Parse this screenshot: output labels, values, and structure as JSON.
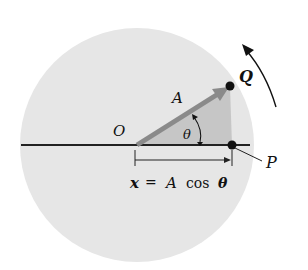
{
  "diagram": {
    "labels": {
      "origin": "O",
      "amplitude": "A",
      "angle": "θ",
      "point_q": "Q",
      "point_p": "P",
      "equation_x": "x",
      "equation_eq": "=",
      "equation_a": "A",
      "equation_cos": "cos",
      "equation_theta": "θ"
    },
    "colors": {
      "background": "#ffffff",
      "circle_fill": "#e6e6e6",
      "triangle_fill": "#c4c4c4",
      "vector": "#8a8a8a",
      "line": "#222222",
      "point": "#111111"
    },
    "geometry": {
      "circle_center": [
        137,
        145
      ],
      "circle_radius": 117,
      "origin": [
        136,
        145
      ],
      "q_point": [
        230,
        86
      ],
      "p_point": [
        232,
        145
      ]
    }
  }
}
